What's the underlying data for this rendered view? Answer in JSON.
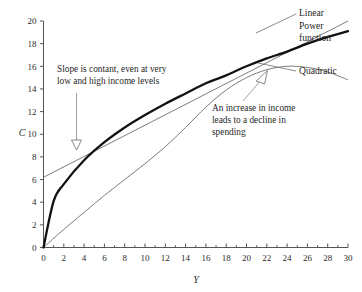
{
  "chart_data": {
    "type": "line",
    "title": "",
    "xlabel": "Y",
    "ylabel": "C",
    "xlim": [
      0,
      30
    ],
    "ylim": [
      0,
      20
    ],
    "xticks": [
      0,
      2,
      4,
      6,
      8,
      10,
      12,
      14,
      16,
      18,
      20,
      22,
      24,
      26,
      28,
      30
    ],
    "yticks": [
      0,
      2,
      4,
      6,
      8,
      10,
      12,
      14,
      16,
      18,
      20
    ],
    "xtick_labels": [
      "0",
      "2",
      "4",
      "6",
      "8",
      "10",
      "12",
      "14",
      "16",
      "18",
      "20",
      "22",
      "24",
      "26",
      "28",
      "30"
    ],
    "ytick_labels": [
      "0",
      "2",
      "4",
      "6",
      "8",
      "10",
      "12",
      "14",
      "16",
      "18",
      "20"
    ],
    "grid": false,
    "legend_position": "right-inline-labels",
    "series": [
      {
        "name": "Linear",
        "style": "thin-gray",
        "x": [
          0,
          5,
          10,
          15,
          20,
          25,
          30
        ],
        "values": [
          6.2,
          8.5,
          10.8,
          13.1,
          15.4,
          17.7,
          20.0
        ]
      },
      {
        "name": "Power function",
        "style": "thick-black",
        "x": [
          0,
          1,
          2,
          4,
          6,
          8,
          10,
          12,
          14,
          16,
          18,
          20,
          22,
          24,
          26,
          28,
          30
        ],
        "values": [
          0.0,
          4.1,
          5.6,
          7.7,
          9.3,
          10.6,
          11.7,
          12.7,
          13.6,
          14.5,
          15.2,
          16.0,
          16.7,
          17.3,
          18.0,
          18.6,
          19.1
        ]
      },
      {
        "name": "Quadratic",
        "style": "thin-gray",
        "x": [
          0,
          2,
          4,
          6,
          8,
          10,
          12,
          14,
          16,
          18,
          20,
          22,
          24,
          26,
          28,
          30
        ],
        "values": [
          0.0,
          1.6,
          3.1,
          4.6,
          6.0,
          7.4,
          8.9,
          10.6,
          12.4,
          13.9,
          15.0,
          15.7,
          16.0,
          15.9,
          15.5,
          14.8
        ]
      }
    ],
    "annotations": [
      {
        "name": "linear-slope-note",
        "lines": [
          "Slope is contant, even at very",
          "low and high income levels"
        ],
        "points_to": "Linear",
        "arrow": "down"
      },
      {
        "name": "quadratic-decline-note",
        "lines": [
          "An increase in income",
          "leads to a decline in",
          "spending"
        ],
        "points_to": "Quadratic",
        "arrow": "up"
      }
    ],
    "curve_labels": [
      {
        "name": "Linear",
        "label": "Linear"
      },
      {
        "name": "Power function",
        "label_line1": "Power",
        "label_line2": "function"
      },
      {
        "name": "Quadratic",
        "label": "Quadratic"
      }
    ],
    "colors": {
      "thin_curve": "#6d6d6d",
      "thick_curve": "#121212",
      "axis": "#555555",
      "text": "#1f1f1f",
      "background": "#ffffff"
    }
  }
}
